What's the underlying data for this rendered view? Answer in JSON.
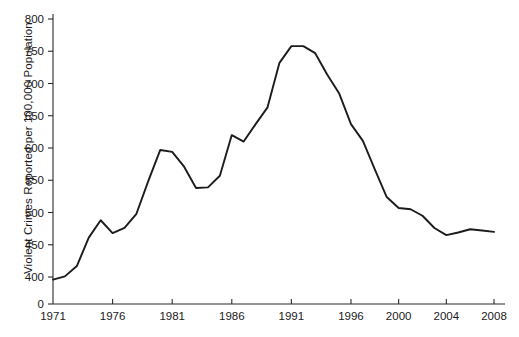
{
  "chart_data": {
    "type": "line",
    "title": "",
    "subtitle": "",
    "xlabel": "",
    "ylabel": "Violent Crimes Reported per 100,000 Population",
    "xlim": [
      1971,
      2008
    ],
    "ylim": [
      400,
      800
    ],
    "y_axis_has_zero_break": true,
    "grid": false,
    "legend": null,
    "x_tick_labels": [
      "1971",
      "1976",
      "1981",
      "1986",
      "1991",
      "1996",
      "2000",
      "2004",
      "2008"
    ],
    "x_tick_values": [
      1971,
      1976,
      1981,
      1986,
      1991,
      1996,
      2000,
      2004,
      2008
    ],
    "y_tick_labels": [
      "0",
      "400",
      "450",
      "500",
      "550",
      "600",
      "650",
      "700",
      "750",
      "800"
    ],
    "y_tick_values": [
      0,
      400,
      450,
      500,
      550,
      600,
      650,
      700,
      750,
      800
    ],
    "series": [
      {
        "name": "Violent crime rate",
        "x": [
          1971,
          1972,
          1973,
          1974,
          1975,
          1976,
          1977,
          1978,
          1979,
          1980,
          1981,
          1982,
          1983,
          1984,
          1985,
          1986,
          1987,
          1988,
          1989,
          1990,
          1991,
          1992,
          1993,
          1994,
          1995,
          1996,
          1997,
          1998,
          1999,
          2000,
          2001,
          2002,
          2003,
          2004,
          2005,
          2006,
          2007,
          2008
        ],
        "values": [
          396,
          401,
          417,
          461,
          488,
          468,
          476,
          498,
          549,
          597,
          594,
          571,
          538,
          539,
          557,
          620,
          610,
          637,
          663,
          732,
          758,
          758,
          747,
          714,
          685,
          637,
          611,
          567,
          524,
          507,
          505,
          495,
          476,
          465,
          469,
          474,
          472,
          470
        ]
      }
    ],
    "annotations": []
  },
  "axis": {
    "y_title": "Violent Crimes Reported per 100,000 Population"
  }
}
